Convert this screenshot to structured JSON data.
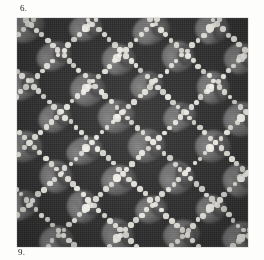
{
  "page": {
    "background_color": "#fdfdfc"
  },
  "caption_top": {
    "text": "6."
  },
  "caption_bottom": {
    "text": "9."
  },
  "plate": {
    "name": "textile-pattern-plate",
    "description": "Dark ground textile with diamond lattice of white dots and gray floral motifs",
    "ground_color": "#2e2e2e",
    "dot_color": "#e9e7e0",
    "motif_color": "#6e6e6e",
    "motif_highlight_color": "#8a8a8a",
    "motif_shadow_color": "#3a3a3a",
    "border_color": "#cfcfcf",
    "geometry": {
      "left": 17,
      "top": 18,
      "width": 231,
      "height": 229,
      "lattice_period_x": 62,
      "lattice_period_y": 60,
      "dot_spacing": 7.4,
      "dot_radius": 2.5,
      "center_dot_radius": 3.6
    }
  },
  "chart_data": {
    "type": "heatmap",
    "title": "6.",
    "xlabel": "",
    "ylabel": "",
    "grid": true,
    "legend": false
  }
}
